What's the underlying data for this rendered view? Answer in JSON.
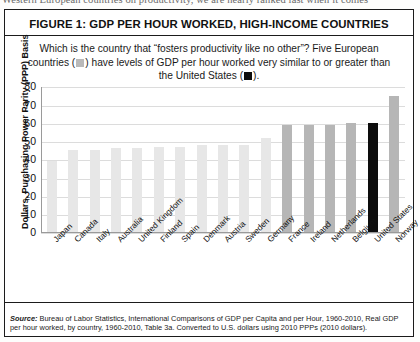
{
  "page_bleed_text": "Western European countries on productivity, we are nearly ranked last when it comes",
  "figure": {
    "title": "FIGURE 1: GDP PER HOUR WORKED, HIGH-INCOME COUNTRIES",
    "subtitle_part1": "Which is the country that “fosters productivity like no other”? Five European countries (",
    "subtitle_part2": ") have levels of GDP per hour worked very similar to or greater than the United States (",
    "subtitle_part3": ").",
    "source_label": "Source:",
    "source_text": " Bureau of Labor Statistics, International Comparisons of GDP per Capita and per Hour, 1960-2010, Real GDP per hour worked, by country, 1960-2010, Table 3a. Converted to U.S. dollars using 2010 PPPs (2010 dollars)."
  },
  "chart_data": {
    "type": "bar",
    "title": "FIGURE 1: GDP PER HOUR WORKED, HIGH-INCOME COUNTRIES",
    "xlabel": "",
    "ylabel": "Dollars, Purchasing Power Parity (PPP) Basis",
    "ylim": [
      0,
      80
    ],
    "yticks": [
      0,
      10,
      20,
      30,
      40,
      50,
      60,
      70,
      80
    ],
    "grid": true,
    "legend_position": "none",
    "categories": [
      "Japan",
      "Canada",
      "Italy",
      "Australia",
      "United Kingdom",
      "Finland",
      "Spain",
      "Denmark",
      "Austria",
      "Sweden",
      "Germany",
      "France",
      "Ireland",
      "Netherlands",
      "Belgium",
      "United States",
      "Norway"
    ],
    "values": [
      39,
      45,
      45,
      46,
      46,
      47,
      47,
      48,
      48,
      48,
      52,
      59,
      59,
      59,
      60,
      60,
      75
    ],
    "bar_styles": [
      "light",
      "light",
      "light",
      "light",
      "light",
      "light",
      "light",
      "light",
      "light",
      "light",
      "light",
      "mid",
      "mid",
      "mid",
      "mid",
      "dark",
      "mid"
    ],
    "colors": {
      "light_bar": "#e7e7e7",
      "mid_bar": "#b6b6b6",
      "dark_bar": "#0d0d0d",
      "gridline": "#dcdcdc",
      "axis": "#9a9a9a"
    }
  }
}
